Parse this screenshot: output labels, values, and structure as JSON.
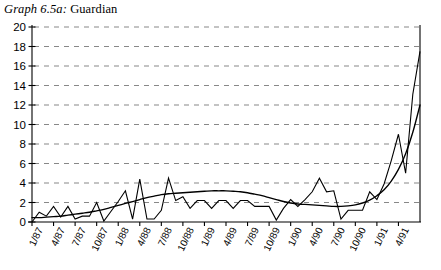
{
  "title": {
    "graph_no": "Graph 6.5a:",
    "publication": "Guardian",
    "full": "Graph 6.5a: Guardian"
  },
  "colors": {
    "line": "#000000",
    "trend": "#000000",
    "grid": "#888888",
    "axis": "#000000",
    "background": "#ffffff"
  },
  "chart_data": {
    "type": "line",
    "title": "Graph 6.5a: Guardian",
    "xlabel": "",
    "ylabel": "",
    "ylim": [
      0,
      20
    ],
    "ytick_step": 2,
    "yticks": [
      "0",
      "2",
      "4",
      "6",
      "8",
      "10",
      "12",
      "14",
      "16",
      "18",
      "20"
    ],
    "grid": "horizontal-dashed",
    "legend": "none",
    "xticklabels": [
      "1/87",
      "4/87",
      "7/87",
      "10/87",
      "1/88",
      "4/88",
      "7/88",
      "10/88",
      "1/89",
      "4/89",
      "7/89",
      "10/89",
      "1/90",
      "4/90",
      "7/90",
      "10/90",
      "1/91",
      "4/91"
    ],
    "xtick_interval_months": 3,
    "x_start": "1/87",
    "x_end": "6/91",
    "series": [
      {
        "name": "Monthly articles",
        "style": "jagged",
        "values": [
          0,
          1,
          0.6,
          1.6,
          0.5,
          1.6,
          0.3,
          0.6,
          0.6,
          2,
          0.1,
          1.1,
          2.1,
          3.2,
          0.3,
          4.4,
          0.3,
          0.3,
          1.2,
          4.5,
          2.2,
          2.6,
          1.4,
          2.2,
          2.2,
          1.4,
          2.2,
          2.2,
          1.4,
          2.2,
          2.2,
          1.6,
          1.6,
          1.6,
          0.2,
          1.4,
          2.3,
          1.6,
          2.3,
          3.1,
          4.5,
          3.1,
          3.2,
          0.3,
          1.2,
          1.2,
          1.2,
          3.1,
          2.3,
          3.9,
          6.3,
          9.0,
          5.0,
          13.1,
          17.5
        ]
      },
      {
        "name": "Smoothed trend",
        "style": "smooth",
        "values": [
          0.45,
          0.45,
          0.5,
          0.55,
          0.6,
          0.7,
          0.8,
          0.9,
          1.0,
          1.15,
          1.3,
          1.5,
          1.7,
          1.9,
          2.1,
          2.3,
          2.5,
          2.65,
          2.8,
          2.9,
          2.95,
          3.0,
          3.05,
          3.1,
          3.15,
          3.2,
          3.2,
          3.2,
          3.15,
          3.1,
          3.0,
          2.85,
          2.7,
          2.5,
          2.3,
          2.1,
          1.95,
          1.85,
          1.8,
          1.75,
          1.7,
          1.65,
          1.6,
          1.6,
          1.65,
          1.75,
          1.95,
          2.25,
          2.7,
          3.3,
          4.2,
          5.4,
          7.0,
          9.2,
          12.0
        ]
      }
    ]
  }
}
